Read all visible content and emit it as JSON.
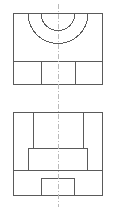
{
  "drawing": {
    "title": "Two-view orthographic engineering drawing",
    "sheet": {
      "width": 116,
      "height": 211,
      "background": "#ffffff"
    },
    "style": {
      "object_line_color": "#5a5a5a",
      "center_line_color": "#b9b9b9",
      "object_line_width": 1,
      "center_line_width": 1,
      "center_line_dash": "5 2 1 2"
    },
    "center_line": {
      "name": "vertical-center-line",
      "x": 58,
      "y_start": 4,
      "y_end": 207
    },
    "views": [
      {
        "id": "top-view",
        "label": "top-view",
        "outline": {
          "x": 13,
          "y": 13,
          "width": 90,
          "height": 72
        },
        "divider": {
          "name": "horizontal-divider",
          "y": 61,
          "x_start": 13,
          "x_end": 103
        },
        "arcs": [
          {
            "name": "outer-arc",
            "center_x": 58,
            "center_y": 13,
            "radius": 30,
            "start_x": 28,
            "end_x": 88,
            "bottom_y": 43,
            "sweep": "semicircle-down"
          },
          {
            "name": "inner-arc",
            "center_x": 58,
            "center_y": 13,
            "radius": 17,
            "start_x": 41,
            "end_x": 75,
            "bottom_y": 30,
            "sweep": "semicircle-down"
          }
        ],
        "vertical_dividers": [
          {
            "name": "left-rib-line",
            "x": 41,
            "y_start": 61,
            "y_end": 85
          },
          {
            "name": "right-rib-line",
            "x": 75,
            "y_start": 61,
            "y_end": 85
          }
        ]
      },
      {
        "id": "front-view",
        "label": "front-view",
        "outline": {
          "x": 13,
          "y": 112,
          "width": 90,
          "height": 84
        },
        "vertical_dividers": [
          {
            "name": "left-slot-line",
            "x": 33,
            "y_start": 112,
            "y_end": 148
          },
          {
            "name": "right-slot-line",
            "x": 83,
            "y_start": 112,
            "y_end": 148
          }
        ],
        "inner_block": {
          "name": "center-boss",
          "x": 28,
          "y": 148,
          "width": 60,
          "height": 22
        },
        "base_divider": {
          "name": "base-top-line",
          "y": 170,
          "x_start": 13,
          "x_end": 103
        },
        "bottom_notch": {
          "name": "bottom-slot",
          "x": 41,
          "y": 178,
          "width": 34,
          "height": 18
        }
      }
    ]
  }
}
